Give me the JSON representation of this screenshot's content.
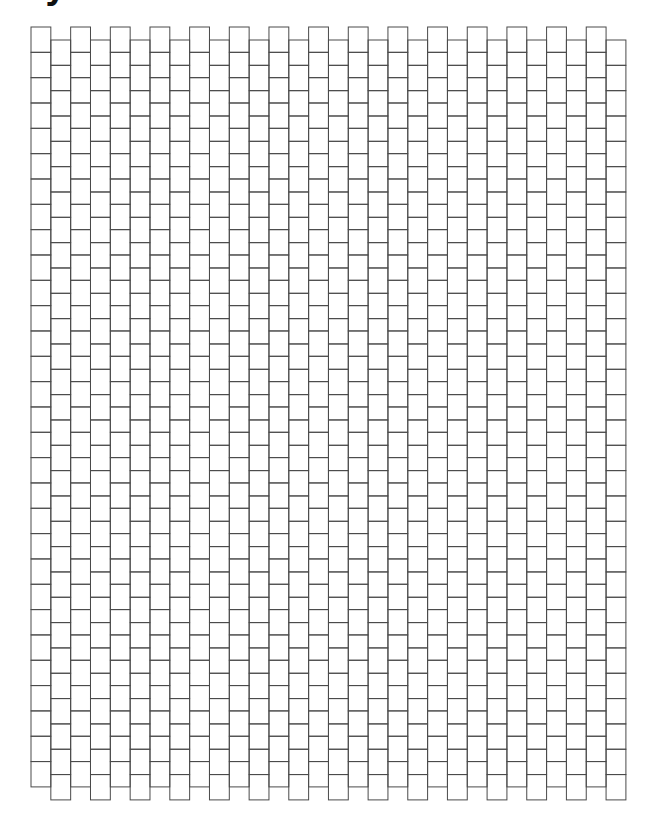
{
  "page": {
    "title_fragment": "y",
    "background": "#ffffff",
    "line_color": "#4a4a4a"
  },
  "grid": {
    "type": "staggered-brick-columns",
    "origin_x": 31,
    "column_width": 19.83,
    "columns": 30,
    "rows_per_column": 30,
    "row_height": 25.33,
    "high_column_top": 27,
    "low_column_top": 40,
    "line_width": 1
  }
}
